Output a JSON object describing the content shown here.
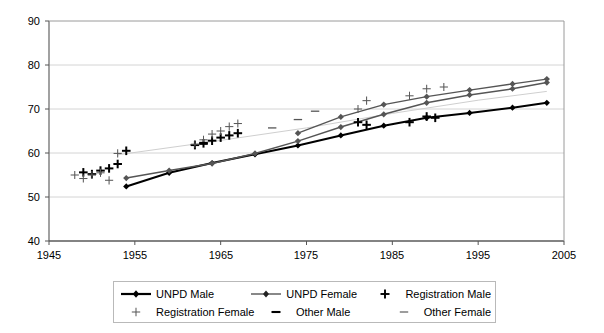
{
  "chart_data": {
    "type": "line",
    "title": "",
    "subtitle": "",
    "xlabel": "",
    "ylabel": "",
    "xlim": [
      1945,
      2005
    ],
    "ylim": [
      40,
      90
    ],
    "xticks": [
      1945,
      1955,
      1965,
      1975,
      1985,
      1995,
      2005
    ],
    "yticks": [
      40,
      50,
      60,
      70,
      80,
      90
    ],
    "grid": "horizontal",
    "legend_position": "bottom",
    "series": [
      {
        "name": "UNPD Male",
        "style": "line-marker",
        "color": "#000000",
        "marker": "diamond",
        "linewidth": 2.1,
        "x": [
          1954,
          1959,
          1964,
          1969,
          1974,
          1979,
          1984,
          1989,
          1994,
          1999,
          2003
        ],
        "values": [
          52.4,
          55.5,
          57.7,
          59.7,
          61.7,
          64.0,
          66.2,
          68.0,
          69.1,
          70.3,
          71.4
        ]
      },
      {
        "name": "UNPD Female",
        "style": "line-marker",
        "color": "#555555",
        "marker": "diamond",
        "linewidth": 1.5,
        "x": [
          1954,
          1959,
          1964,
          1969,
          1974,
          1979,
          1984,
          1989,
          1994,
          1999,
          2003
        ],
        "values": [
          54.3,
          56.0,
          57.6,
          59.9,
          62.7,
          65.9,
          68.8,
          71.4,
          73.2,
          74.6,
          76.0
        ]
      },
      {
        "name": "UNPD Female (upper)",
        "style": "line-marker",
        "color": "#555555",
        "marker": "diamond",
        "linewidth": 1.3,
        "x": [
          1974,
          1979,
          1984,
          1989,
          1994,
          1999,
          2003
        ],
        "values": [
          64.5,
          68.2,
          71.0,
          72.8,
          74.3,
          75.7,
          76.8
        ]
      },
      {
        "name": "Registration Male",
        "style": "marker-only",
        "color": "#000000",
        "marker": "plus-bold",
        "x": [
          1949,
          1950,
          1951,
          1952,
          1953,
          1954,
          1962,
          1963,
          1964,
          1965,
          1966,
          1967,
          1981,
          1982,
          1987,
          1989,
          1990
        ],
        "values": [
          55.6,
          55.2,
          56.0,
          56.5,
          57.5,
          60.5,
          61.8,
          62.2,
          62.8,
          63.5,
          64.0,
          64.5,
          67.0,
          66.4,
          67.0,
          68.3,
          68.0
        ]
      },
      {
        "name": "Registration Female",
        "style": "marker-only",
        "color": "#5a5a5a",
        "marker": "plus-thin",
        "x": [
          1948,
          1949,
          1950,
          1951,
          1952,
          1953,
          1962,
          1963,
          1964,
          1965,
          1966,
          1967,
          1981,
          1982,
          1987,
          1989,
          1991
        ],
        "values": [
          55.0,
          54.2,
          55.0,
          55.5,
          53.8,
          59.9,
          62.0,
          63.0,
          64.3,
          65.0,
          66.0,
          66.7,
          70.0,
          71.9,
          73.0,
          74.6,
          75.0
        ]
      },
      {
        "name": "Other Male",
        "style": "marker-only",
        "color": "#000000",
        "marker": "dash-bold",
        "x": [
          1963
        ],
        "values": [
          62.2
        ]
      },
      {
        "name": "Other Female",
        "style": "marker-only",
        "color": "#555555",
        "marker": "dash-thin",
        "x": [
          1971,
          1974,
          1976
        ],
        "values": [
          65.7,
          67.6,
          69.5
        ]
      }
    ],
    "guide_line": {
      "name": "registration-female-trend",
      "color": "#cfcfcf",
      "x": [
        1953,
        1963,
        1975,
        1985,
        1995,
        2003
      ],
      "values": [
        59.6,
        62.3,
        65.7,
        69.0,
        72.0,
        74.0
      ]
    }
  },
  "legend": {
    "rows": [
      [
        {
          "key": "line-diamond-bold",
          "label": "UNPD Male"
        },
        {
          "key": "line-diamond-thin",
          "label": "UNPD Female"
        },
        {
          "key": "plus-bold",
          "label": "Registration Male"
        }
      ],
      [
        {
          "key": "plus-thin",
          "label": "Registration Female"
        },
        {
          "key": "dash-bold",
          "label": "Other Male"
        },
        {
          "key": "dash-thin",
          "label": "Other Female"
        }
      ]
    ]
  },
  "axes": {
    "y_tick_labels": [
      "90",
      "80",
      "70",
      "60",
      "50",
      "40"
    ],
    "x_tick_labels": [
      "1945",
      "1955",
      "1965",
      "1975",
      "1985",
      "1995",
      "2005"
    ]
  }
}
